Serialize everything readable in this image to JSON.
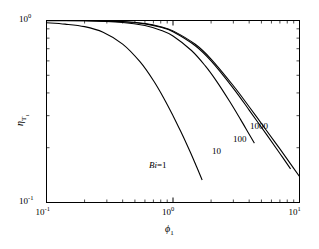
{
  "figure": {
    "background": "#ffffff",
    "line_color": "#000000",
    "axis_color": "#000000"
  },
  "axes": {
    "x": {
      "label": "ϕ",
      "label_sub": "1",
      "ticks": [
        {
          "value": 0.1,
          "mantissa": "10",
          "exponent": "-1"
        },
        {
          "value": 1.0,
          "mantissa": "10",
          "exponent": "0"
        },
        {
          "value": 10.0,
          "mantissa": "10",
          "exponent": "1"
        }
      ]
    },
    "y": {
      "label": "η",
      "label_sub": "T",
      "label_sub2": "1",
      "ticks": [
        {
          "value": 0.1,
          "mantissa": "10",
          "exponent": "-1"
        },
        {
          "value": 1.0,
          "mantissa": "10",
          "exponent": "0"
        }
      ]
    }
  },
  "curve_labels": [
    {
      "id": "bi-1",
      "text_italic": "Bi",
      "text": "=1",
      "x": 149,
      "y": 160
    },
    {
      "id": "bi-10",
      "text_italic": "",
      "text": "10",
      "x": 212,
      "y": 146
    },
    {
      "id": "bi-100",
      "text_italic": "",
      "text": "100",
      "x": 233,
      "y": 134
    },
    {
      "id": "bi-1000",
      "text_italic": "",
      "text": "1000",
      "x": 250,
      "y": 121
    }
  ],
  "chart_data": {
    "type": "line",
    "title": "",
    "xlabel": "ϕ₁",
    "ylabel": "η_T₁",
    "xscale": "log",
    "yscale": "log",
    "xlim": [
      0.1,
      10
    ],
    "ylim": [
      0.1,
      1.0
    ],
    "grid": false,
    "legend": "inline-curve-labels",
    "series": [
      {
        "name": "Bi=1",
        "bi": 1,
        "x": [
          0.1,
          0.14,
          0.2,
          0.28,
          0.4,
          0.55,
          0.7,
          0.85,
          1.0,
          1.15,
          1.3,
          1.45,
          1.6,
          1.7
        ],
        "y": [
          0.972,
          0.955,
          0.925,
          0.862,
          0.742,
          0.592,
          0.468,
          0.372,
          0.3,
          0.246,
          0.205,
          0.173,
          0.147,
          0.133
        ]
      },
      {
        "name": "Bi=10",
        "bi": 10,
        "x": [
          0.1,
          0.2,
          0.4,
          0.6,
          0.8,
          1.0,
          1.4,
          1.8,
          2.2,
          2.8,
          3.4,
          4.0,
          4.4
        ],
        "y": [
          0.999,
          0.996,
          0.975,
          0.938,
          0.885,
          0.822,
          0.684,
          0.563,
          0.466,
          0.36,
          0.288,
          0.237,
          0.212
        ]
      },
      {
        "name": "Bi=100",
        "bi": 100,
        "x": [
          0.1,
          0.2,
          0.4,
          0.6,
          0.8,
          1.0,
          1.5,
          2.0,
          3.0,
          4.0,
          5.5,
          7.0,
          8.5
        ],
        "y": [
          1.0,
          0.999,
          0.985,
          0.958,
          0.918,
          0.868,
          0.727,
          0.6,
          0.424,
          0.322,
          0.236,
          0.186,
          0.153
        ]
      },
      {
        "name": "Bi=1000",
        "bi": 1000,
        "x": [
          0.1,
          0.2,
          0.4,
          0.6,
          0.8,
          1.0,
          1.5,
          2.0,
          3.0,
          4.0,
          5.5,
          7.0,
          9.0,
          10.0
        ],
        "y": [
          1.0,
          1.0,
          0.987,
          0.962,
          0.924,
          0.877,
          0.74,
          0.614,
          0.438,
          0.336,
          0.248,
          0.197,
          0.154,
          0.139
        ]
      }
    ]
  }
}
